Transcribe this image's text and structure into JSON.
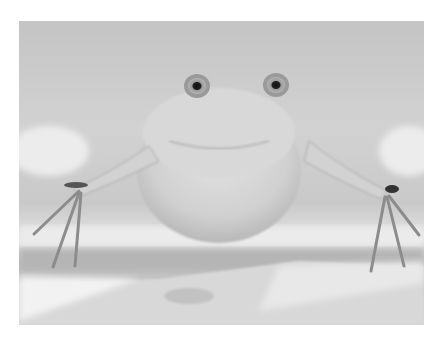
{
  "image": {
    "subject": "frog",
    "description": "Grayscale photograph of a pale frog facing the camera underwater, front legs spread with long thin toes resting on a surface",
    "palette": {
      "background": "#ffffff",
      "water_light": "#e6e6e6",
      "water_mid": "#c8c8c8",
      "water_dark": "#a9a9a9",
      "frog_body": "#d9d9d9",
      "frog_shadow": "#b4b4b4",
      "eye_ring": "#8a8a8a",
      "pupil": "#1e1e1e"
    }
  }
}
